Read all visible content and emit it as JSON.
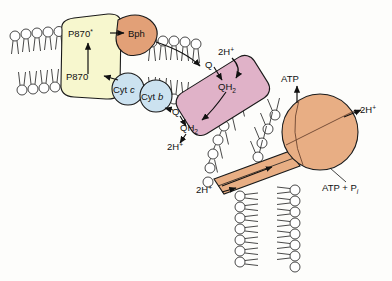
{
  "figure": {
    "background_color": "#fdfdfb"
  },
  "colors": {
    "reaction_center_fill": "#f7f7ce",
    "bph_fill": "#e2a077",
    "cytochrome_fill": "#cce2f0",
    "bc1_complex_fill": "#e0b2c8",
    "atp_synthase_fill": "#e8ae84",
    "outline": "#1a1a1a",
    "membrane_head_fill": "#ffffff"
  },
  "complexes": [
    {
      "id": "reaction-center",
      "label": "",
      "fill": "#f7f7ce"
    },
    {
      "id": "bph",
      "label": "Bph",
      "fill": "#e2a077"
    },
    {
      "id": "cyt-c",
      "label_prefix": "Cyt ",
      "label_italic": "c",
      "fill": "#cce2f0"
    },
    {
      "id": "cyt-b",
      "label_prefix": "Cyt ",
      "label_italic": "b",
      "fill": "#cce2f0"
    },
    {
      "id": "bc1-complex",
      "label": "",
      "fill": "#e0b2c8"
    },
    {
      "id": "atp-synthase-head",
      "label": "",
      "fill": "#e8ae84"
    },
    {
      "id": "atp-synthase-channel",
      "label": "",
      "fill": "#e8ae84"
    }
  ],
  "labels": {
    "p870_excited_base": "P870",
    "p870_excited_star": "*",
    "p870_ground": "P870",
    "bph": "Bph",
    "cyt_c_prefix": "Cyt ",
    "cyt_c_italic": "c",
    "cyt_b_prefix": "Cyt ",
    "cyt_b_italic": "b",
    "q_top": "Q",
    "qh2_top_base": "QH",
    "qh2_top_sub": "2",
    "two_h_top_base": "2H",
    "two_h_top_sup": "+",
    "q_bottom": "Q",
    "qh2_bottom_base": "QH",
    "qh2_bottom_sub": "2",
    "two_h_bottom_base": "2H",
    "two_h_bottom_sup": "+",
    "two_h_synthase_in_base": "2H",
    "two_h_synthase_in_sup": "+",
    "two_h_synthase_out_base": "2H",
    "two_h_synthase_out_sup": "+",
    "atp": "ATP",
    "adp_pi_base": "ATP + P",
    "adp_pi_sub": "i"
  }
}
